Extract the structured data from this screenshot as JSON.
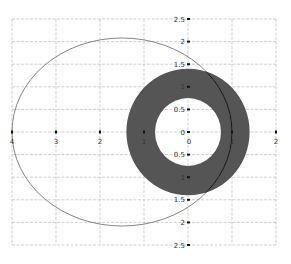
{
  "chart_data": {
    "type": "scatter",
    "title": "",
    "xlabel": "",
    "ylabel": "",
    "xlim": [
      -4,
      2
    ],
    "ylim": [
      -2.5,
      2.5
    ],
    "grid": true,
    "legend": null,
    "x_ticks": [
      -4,
      -3,
      -2,
      -1,
      0,
      1,
      2
    ],
    "x_tick_labels": [
      "4",
      "3",
      "2",
      "1",
      "0",
      "1",
      "2"
    ],
    "y_ticks": [
      2.5,
      2,
      1.5,
      1,
      0.5,
      0,
      -0.5,
      -1,
      -1.5,
      -2,
      -2.5
    ],
    "y_tick_labels": [
      "2.5",
      "2",
      "1.5",
      "1",
      "0.5",
      "0",
      "0.5",
      "1",
      "1.5",
      "2",
      "2.5"
    ],
    "shapes": [
      {
        "name": "annulus",
        "kind": "ring",
        "center": [
          0,
          0
        ],
        "inner_radius": 0.75,
        "outer_radius": 1.4,
        "fill": "#555555"
      },
      {
        "name": "ellipse",
        "kind": "ellipse-outline",
        "center": [
          -1.5,
          0
        ],
        "semi_x": 2.5,
        "semi_y": 2.08,
        "stroke": "#777777"
      }
    ]
  },
  "colors": {
    "grid": "#bbbbbb",
    "ring": "#555555",
    "ellipse": "#777777",
    "axis_marker": "#111111"
  }
}
